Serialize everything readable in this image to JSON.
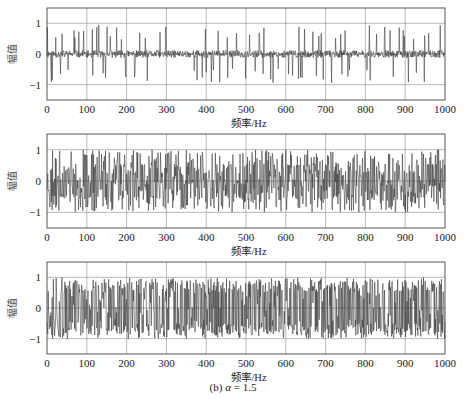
{
  "chart_data": [
    {
      "type": "line",
      "panel": 1,
      "title": "",
      "xlabel": "频率/Hz",
      "ylabel": "幅值",
      "xlim": [
        0,
        1000
      ],
      "ylim": [
        -1.5,
        1.5
      ],
      "xticks": [
        0,
        100,
        200,
        300,
        400,
        500,
        600,
        700,
        800,
        900,
        1000
      ],
      "yticks": [
        -1,
        0,
        1
      ],
      "grid": true,
      "description": "Noisy signal centered near 0, mostly within ±0.3, with sparse spikes reaching about +0.95 and -0.95",
      "seed": 11,
      "base_amp": 0.12,
      "spike_prob": 0.09,
      "spike_amp": 0.95,
      "clip": 1.0
    },
    {
      "type": "line",
      "panel": 2,
      "title": "",
      "xlabel": "频率/Hz",
      "ylabel": "幅值",
      "xlim": [
        0,
        1000
      ],
      "ylim": [
        -1.5,
        1.5
      ],
      "xticks": [
        0,
        100,
        200,
        300,
        400,
        500,
        600,
        700,
        800,
        900,
        1000
      ],
      "yticks": [
        -1,
        0,
        1
      ],
      "grid": true,
      "description": "Dense oscillating signal filling roughly [-1, 1]",
      "seed": 23,
      "base_amp": 0.55,
      "spike_prob": 0.35,
      "spike_amp": 1.0,
      "clip": 1.0
    },
    {
      "type": "line",
      "panel": 3,
      "title": "",
      "xlabel": "频率/Hz",
      "ylabel": "幅值",
      "xlim": [
        0,
        1000
      ],
      "ylim": [
        -1.5,
        1.5
      ],
      "xticks": [
        0,
        100,
        200,
        300,
        400,
        500,
        600,
        700,
        800,
        900,
        1000
      ],
      "yticks": [
        -1,
        0,
        1
      ],
      "grid": true,
      "description": "Very dense signal saturating at ±1 across the full range",
      "seed": 37,
      "base_amp": 0.9,
      "spike_prob": 0.6,
      "spike_amp": 1.0,
      "clip": 1.0
    }
  ],
  "caption": {
    "prefix": "(b) ",
    "symbol": "α",
    "suffix": " = 1.5"
  },
  "colors": {
    "line": "#333333",
    "grid": "#8a8a8a",
    "axis": "#444444"
  }
}
